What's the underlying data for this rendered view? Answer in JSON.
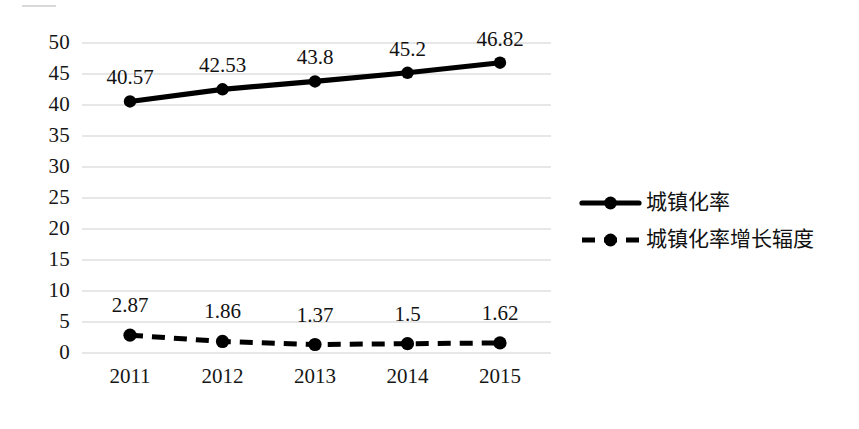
{
  "chart_data": {
    "type": "line",
    "title": "",
    "subtitle": "",
    "xlabel": "",
    "ylabel": "",
    "categories": [
      "2011",
      "2012",
      "2013",
      "2014",
      "2015"
    ],
    "series": [
      {
        "name": "城镇化率",
        "style": "solid",
        "marker": "filled-circle",
        "color": "#000000",
        "values": [
          40.57,
          42.53,
          43.8,
          45.2,
          46.82
        ],
        "labels": [
          "40.57",
          "42.53",
          "43.8",
          "45.2",
          "46.82"
        ]
      },
      {
        "name": "城镇化率增长辐度",
        "style": "dashed",
        "marker": "filled-circle",
        "color": "#000000",
        "values": [
          2.87,
          1.86,
          1.37,
          1.5,
          1.62
        ],
        "labels": [
          "2.87",
          "1.86",
          "1.37",
          "1.5",
          "1.62"
        ]
      }
    ],
    "ylim": [
      0,
      50
    ],
    "ytick_step": 5,
    "yticks": [
      "50",
      "45",
      "40",
      "35",
      "30",
      "25",
      "20",
      "15",
      "10",
      "5",
      "0"
    ],
    "grid": true,
    "grid_color": "#d0d0d0",
    "legend_position": "right"
  },
  "legend": {
    "items": [
      {
        "label": "城镇化率",
        "style": "solid"
      },
      {
        "label": "城镇化率增长辐度",
        "style": "dashed"
      }
    ]
  }
}
